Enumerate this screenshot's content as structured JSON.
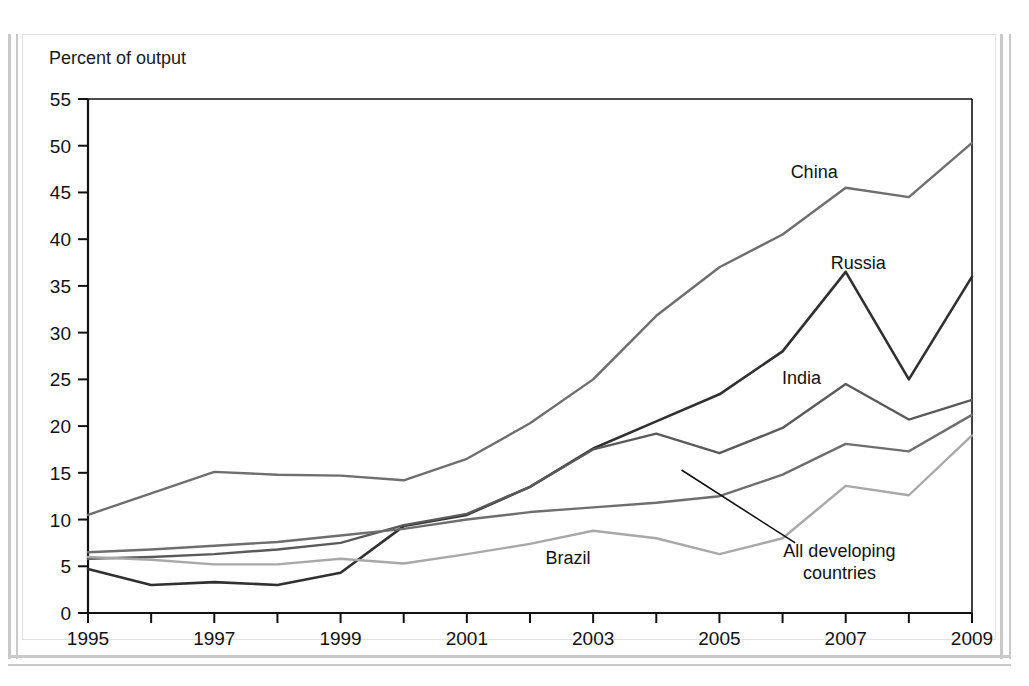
{
  "figure": {
    "axis_title": "Percent of output",
    "background": "#ffffff",
    "frame_color": "#c9c9c9"
  },
  "chart_data": {
    "type": "line",
    "title": "",
    "subtitle": "",
    "xlabel": "",
    "ylabel": "Percent of output",
    "xlim": [
      1995,
      2009
    ],
    "ylim": [
      0,
      55
    ],
    "ytick_step": 5,
    "xtick_step": 1,
    "xtick_label_step": 2,
    "grid": false,
    "legend": "inline-annotations",
    "x": [
      1995,
      1996,
      1997,
      1998,
      1999,
      2000,
      2001,
      2002,
      2003,
      2004,
      2005,
      2006,
      2007,
      2008,
      2009
    ],
    "ytick_labels": [
      "0",
      "5",
      "10",
      "15",
      "20",
      "25",
      "30",
      "35",
      "40",
      "45",
      "50",
      "55"
    ],
    "xtick_labels": [
      "1995",
      "",
      "1997",
      "",
      "1999",
      "",
      "2001",
      "",
      "2003",
      "",
      "2005",
      "",
      "2007",
      "",
      "2009"
    ],
    "series": [
      {
        "name": "China",
        "color": "#6e6e6e",
        "width": 2.4,
        "label": "China",
        "label_x": 2006.5,
        "label_y": 46.5,
        "leader": false,
        "values": [
          10.5,
          12.8,
          15.1,
          14.8,
          14.7,
          14.2,
          16.5,
          20.3,
          25.0,
          31.8,
          37.0,
          40.5,
          45.5,
          44.5,
          50.3
        ]
      },
      {
        "name": "Russia",
        "color": "#303030",
        "width": 2.6,
        "label": "Russia",
        "label_x": 2007.2,
        "label_y": 36.8,
        "leader": false,
        "values": [
          4.7,
          3.0,
          3.3,
          3.0,
          4.3,
          9.3,
          10.5,
          13.5,
          17.6,
          20.5,
          23.4,
          28.0,
          36.5,
          25.0,
          36.0
        ]
      },
      {
        "name": "India",
        "color": "#5a5a5a",
        "width": 2.4,
        "label": "India",
        "label_x": 2006.3,
        "label_y": 24.5,
        "leader": false,
        "values": [
          5.8,
          6.0,
          6.3,
          6.8,
          7.5,
          9.4,
          10.6,
          13.5,
          17.5,
          19.2,
          17.1,
          19.8,
          24.5,
          20.7,
          22.8
        ]
      },
      {
        "name": "All developing countries",
        "color": "#6e6e6e",
        "width": 2.4,
        "label": "All developing countries",
        "label_x": 2006.9,
        "label_y": 6.0,
        "leader": true,
        "leader_from_x": 2006.2,
        "leader_from_y": 7.5,
        "leader_to_x": 2004.4,
        "leader_to_y": 15.3,
        "values": [
          6.5,
          6.8,
          7.2,
          7.6,
          8.3,
          9.0,
          10.0,
          10.8,
          11.3,
          11.8,
          12.5,
          14.8,
          18.1,
          17.3,
          21.2
        ]
      },
      {
        "name": "Brazil",
        "color": "#a8a8a8",
        "width": 2.4,
        "label": "Brazil",
        "label_x": 2002.6,
        "label_y": 5.2,
        "leader": false,
        "values": [
          6.0,
          5.7,
          5.2,
          5.2,
          5.8,
          5.3,
          6.3,
          7.4,
          8.8,
          8.0,
          6.3,
          8.0,
          13.6,
          12.6,
          19.0
        ]
      }
    ]
  }
}
